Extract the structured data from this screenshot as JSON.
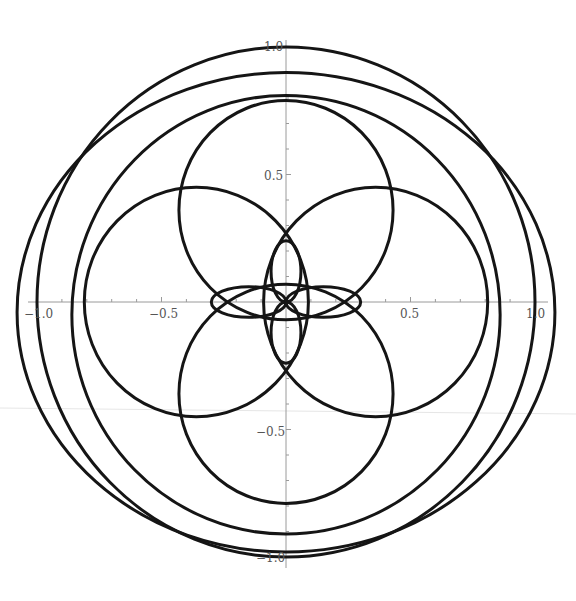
{
  "chart_data": {
    "type": "line",
    "title": "",
    "xlabel": "",
    "ylabel": "",
    "xlim": [
      -1.0,
      1.0
    ],
    "ylim": [
      -1.0,
      1.0
    ],
    "grid": false,
    "legend": null,
    "x_ticks": [
      "-1.0",
      "-0.5",
      "0.5",
      "1.0"
    ],
    "y_ticks": [
      "1.0",
      "0.5",
      "-0.5",
      "-1.0"
    ],
    "x_tick_values": [
      -1.0,
      -0.5,
      0.5,
      1.0
    ],
    "y_tick_values": [
      1.0,
      0.5,
      -0.5,
      -1.0
    ],
    "series": [
      {
        "name": "outer loop",
        "shape": "circle",
        "center": [
          0,
          0
        ],
        "radius": 1.0
      },
      {
        "name": "outer loop 2",
        "shape": "ellipse",
        "center": [
          0,
          -0.04
        ],
        "rx": 1.08,
        "ry": 0.94
      },
      {
        "name": "upper large arc",
        "shape": "circle",
        "center": [
          0,
          -0.05
        ],
        "radius": 0.86
      },
      {
        "name": "medium lobe top",
        "shape": "circle",
        "center": [
          0,
          0.36
        ],
        "radius": 0.43
      },
      {
        "name": "medium lobe bottom",
        "shape": "circle",
        "center": [
          0,
          -0.36
        ],
        "radius": 0.43
      },
      {
        "name": "medium lobe left",
        "shape": "circle",
        "center": [
          -0.36,
          0
        ],
        "radius": 0.45
      },
      {
        "name": "medium lobe right",
        "shape": "circle",
        "center": [
          0.36,
          0
        ],
        "radius": 0.45
      },
      {
        "name": "petal top",
        "shape": "ellipse",
        "center": [
          0,
          0.12
        ],
        "rx": 0.06,
        "ry": 0.12
      },
      {
        "name": "petal bottom",
        "shape": "ellipse",
        "center": [
          0,
          -0.12
        ],
        "rx": 0.06,
        "ry": 0.12
      },
      {
        "name": "petal left",
        "shape": "ellipse",
        "center": [
          -0.15,
          0
        ],
        "rx": 0.15,
        "ry": 0.06
      },
      {
        "name": "petal right",
        "shape": "ellipse",
        "center": [
          0.15,
          0
        ],
        "rx": 0.15,
        "ry": 0.06
      }
    ]
  },
  "axes": {
    "x_labels": [
      "−1.0",
      "−0.5",
      "0.5",
      "1.0"
    ],
    "y_labels": [
      "1.0",
      "0.5",
      "−0.5",
      "−1.0"
    ]
  }
}
